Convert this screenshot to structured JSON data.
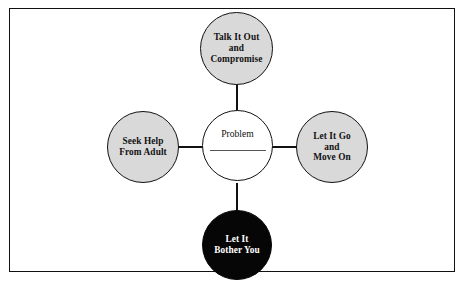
{
  "diagram": {
    "type": "hub-and-spoke",
    "center": {
      "label": "Problem",
      "fill": "#ffffff",
      "text_color": "#111111",
      "has_blank_line": true
    },
    "nodes": [
      {
        "id": "talk-it-out",
        "label": "Talk It Out\nand\nCompromise",
        "position": "top",
        "fill": "#d9d9d9",
        "text_color": "#111111"
      },
      {
        "id": "seek-help",
        "label": "Seek Help\nFrom Adult",
        "position": "left",
        "fill": "#d9d9d9",
        "text_color": "#111111"
      },
      {
        "id": "let-it-go",
        "label": "Let It Go\nand\nMove On",
        "position": "right",
        "fill": "#d9d9d9",
        "text_color": "#111111"
      },
      {
        "id": "let-it-bother-you",
        "label": "Let It\nBother You",
        "position": "bottom",
        "fill": "#060606",
        "text_color": "#ffffff"
      }
    ],
    "colors": {
      "border": "#111111",
      "option_fill": "#d9d9d9",
      "negative_fill": "#060606",
      "center_fill": "#ffffff",
      "background": "#ffffff"
    }
  }
}
